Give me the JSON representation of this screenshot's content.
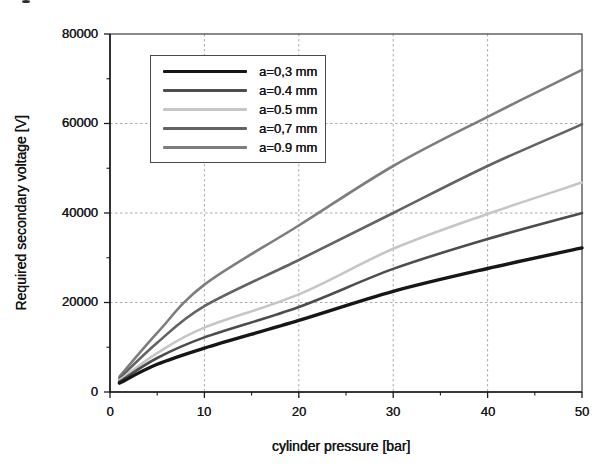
{
  "chart_data": {
    "type": "line",
    "title": "",
    "xlabel": "cylinder pressure [bar]",
    "ylabel": "Required secondary voltage [V]",
    "xlim": [
      0,
      50
    ],
    "ylim": [
      0,
      80000
    ],
    "xticks": [
      0,
      10,
      20,
      30,
      40,
      50
    ],
    "xtick_labels": [
      "0",
      "10",
      "20",
      "30",
      "40",
      "50"
    ],
    "x_minor_ticks": [
      5,
      15,
      25,
      35,
      45
    ],
    "yticks": [
      0,
      20000,
      40000,
      60000,
      80000
    ],
    "ytick_labels": [
      "0",
      "20000",
      "40000",
      "60000",
      "80000"
    ],
    "y_minor_ticks": [
      10000,
      30000,
      50000,
      70000
    ],
    "grid": "dashed",
    "legend_position": "upper-left-inside",
    "x": [
      1,
      5,
      10,
      20,
      30,
      40,
      50
    ],
    "series": [
      {
        "label": "a=0,3 mm",
        "color": "#161616",
        "width": 3.4,
        "values": [
          2000,
          6200,
          9800,
          16000,
          22500,
          27600,
          32200
        ]
      },
      {
        "label": "a=0.4 mm",
        "color": "#4d4d4d",
        "width": 2.6,
        "values": [
          2300,
          7600,
          12200,
          19000,
          27500,
          34200,
          40000
        ]
      },
      {
        "label": "a=0.5 mm",
        "color": "#c6c6c6",
        "width": 2.6,
        "values": [
          2600,
          8700,
          14400,
          21800,
          32000,
          39800,
          46800
        ]
      },
      {
        "label": "a=0,7 mm",
        "color": "#636363",
        "width": 2.6,
        "values": [
          3000,
          11000,
          19200,
          29500,
          40000,
          50500,
          59800
        ]
      },
      {
        "label": "a=0.9 mm",
        "color": "#7d7d7d",
        "width": 2.6,
        "values": [
          3400,
          13200,
          24000,
          37200,
          50500,
          61500,
          72000
        ]
      }
    ],
    "frame_color": "#3c3c3c",
    "axis_color": "#1c1c1c",
    "grid_color": "#ababab"
  }
}
